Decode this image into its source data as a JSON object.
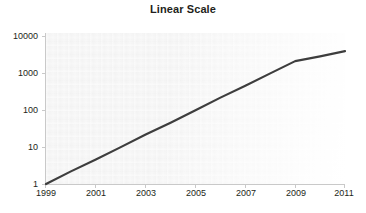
{
  "chart_data": {
    "type": "line",
    "title": "Linear Scale",
    "xlabel": "",
    "ylabel": "",
    "yscale": "log",
    "xscale": "linear",
    "grid": false,
    "legend": false,
    "xlim": [
      1999,
      2011
    ],
    "ylim": [
      1,
      10000
    ],
    "xticks": [
      "1999",
      "2001",
      "2003",
      "2005",
      "2007",
      "2009",
      "2011"
    ],
    "xtick_values": [
      1999,
      2001,
      2003,
      2005,
      2007,
      2009,
      2011
    ],
    "yticks": [
      "1",
      "10",
      "100",
      "1000",
      "10000"
    ],
    "ytick_values": [
      1,
      10,
      100,
      1000,
      10000
    ],
    "series": [
      {
        "name": "growth",
        "color": "#3d3d3d",
        "x": [
          1999,
          2000,
          2001,
          2002,
          2003,
          2004,
          2005,
          2006,
          2007,
          2008,
          2009,
          2010,
          2011
        ],
        "values": [
          1,
          2.2,
          4.6,
          10,
          22,
          46,
          100,
          220,
          460,
          1000,
          2150,
          2900,
          4000
        ]
      }
    ]
  },
  "colors": {
    "line": "#3d3d3d",
    "axis": "#c9c9c9",
    "text": "#231f20",
    "plot_background": "#f2f2f2",
    "figure_background": "#ffffff"
  }
}
